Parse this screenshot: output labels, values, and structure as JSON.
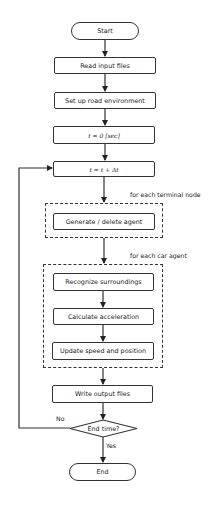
{
  "flowchart": {
    "start": "Start",
    "steps": {
      "read_input": "Read input files",
      "setup_road": "Set up road environment",
      "t_init": "t = 0 [sec]",
      "t_step": "t = t + Δt",
      "generate_delete": "Generate / delete agent",
      "recognize": "Recognize surroundings",
      "calc_accel": "Calculate acceleration",
      "update_speed": "Update speed and position",
      "write_output": "Write output files"
    },
    "loops": {
      "terminal_node": "for each terminal node",
      "car_agent": "for each car agent"
    },
    "decision": {
      "label": "End time?",
      "no": "No",
      "yes": "Yes"
    },
    "end": "End"
  }
}
